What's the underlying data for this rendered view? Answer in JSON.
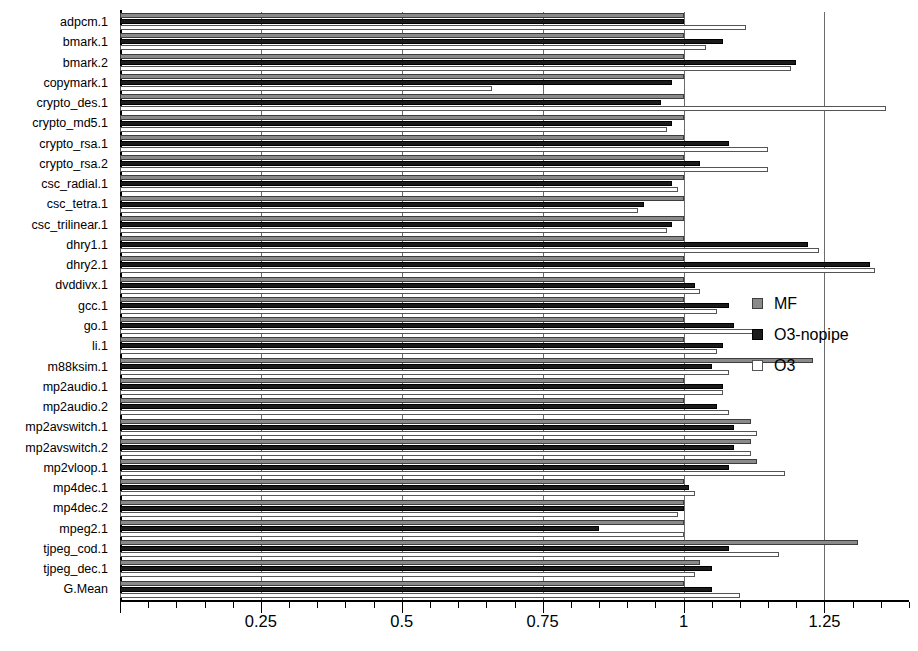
{
  "chart_data": {
    "type": "bar",
    "orientation": "horizontal",
    "title": "",
    "xlabel": "",
    "ylabel": "",
    "xlim": [
      0,
      1.4
    ],
    "grid": true,
    "gridlines": [
      0.25,
      0.5,
      0.75,
      1.0,
      1.25
    ],
    "legend_position": "right",
    "xticks_major": [
      0,
      0.25,
      0.5,
      0.75,
      1.0,
      1.25
    ],
    "xticklabels": [
      "",
      "0.25",
      "0.5",
      "0.75",
      "1",
      "1.25"
    ],
    "xtick_minor_step": 0.05,
    "categories": [
      "adpcm.1",
      "bmark.1",
      "bmark.2",
      "copymark.1",
      "crypto_des.1",
      "crypto_md5.1",
      "crypto_rsa.1",
      "crypto_rsa.2",
      "csc_radial.1",
      "csc_tetra.1",
      "csc_trilinear.1",
      "dhry1.1",
      "dhry2.1",
      "dvddivx.1",
      "gcc.1",
      "go.1",
      "li.1",
      "m88ksim.1",
      "mp2audio.1",
      "mp2audio.2",
      "mp2avswitch.1",
      "mp2avswitch.2",
      "mp2vloop.1",
      "mp4dec.1",
      "mp4dec.2",
      "mpeg2.1",
      "tjpeg_cod.1",
      "tjpeg_dec.1",
      "G.Mean"
    ],
    "series": [
      {
        "name": "MF",
        "color": "#8a8a8a",
        "values": [
          1.0,
          1.0,
          1.0,
          1.0,
          1.0,
          1.0,
          1.0,
          1.0,
          1.0,
          1.0,
          1.0,
          1.0,
          1.0,
          1.0,
          1.0,
          1.0,
          1.0,
          1.23,
          1.0,
          1.0,
          1.12,
          1.12,
          1.13,
          1.0,
          1.0,
          1.0,
          1.31,
          1.03,
          1.0
        ]
      },
      {
        "name": "O3-nopipe",
        "color": "#1b1b1b",
        "values": [
          1.0,
          1.07,
          1.2,
          0.98,
          0.96,
          0.98,
          1.08,
          1.03,
          0.98,
          0.93,
          0.98,
          1.22,
          1.33,
          1.02,
          1.08,
          1.09,
          1.07,
          1.05,
          1.07,
          1.06,
          1.09,
          1.09,
          1.08,
          1.01,
          1.0,
          0.85,
          1.08,
          1.05,
          1.05
        ]
      },
      {
        "name": "O3",
        "color": "#ffffff",
        "values": [
          1.11,
          1.04,
          1.19,
          0.66,
          1.36,
          0.97,
          1.15,
          1.15,
          0.99,
          0.92,
          0.97,
          1.24,
          1.34,
          1.03,
          1.06,
          1.13,
          1.06,
          1.08,
          1.07,
          1.08,
          1.13,
          1.12,
          1.18,
          1.02,
          0.99,
          1.0,
          1.17,
          1.02,
          1.1
        ]
      }
    ]
  },
  "legend": {
    "items": [
      {
        "label": "MF",
        "swatch": "mf"
      },
      {
        "label": "O3-nopipe",
        "swatch": "nopipe"
      },
      {
        "label": "O3",
        "swatch": "o3"
      }
    ]
  },
  "caption": ""
}
